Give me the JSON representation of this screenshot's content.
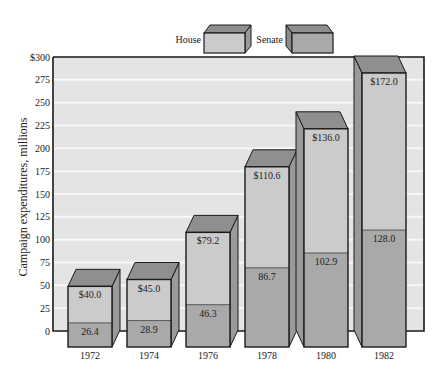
{
  "chart_data": {
    "type": "bar",
    "stacked": true,
    "style": "3d",
    "title": "",
    "xlabel": "",
    "ylabel": "Campaign expenditures, millions",
    "ylim": [
      0,
      300
    ],
    "yticks": [
      "$300",
      "275",
      "250",
      "225",
      "200",
      "175",
      "150",
      "125",
      "100",
      "75",
      "50",
      "25",
      "0"
    ],
    "categories": [
      "1972",
      "1974",
      "1976",
      "1978",
      "1980",
      "1982"
    ],
    "series": [
      {
        "name": "Senate",
        "values": [
          26.4,
          28.9,
          46.3,
          86.7,
          102.9,
          128.0
        ],
        "labels": [
          "26.4",
          "28.9",
          "46.3",
          "86.7",
          "102.9",
          "128.0"
        ],
        "color": "#a9a9a9",
        "position": "bottom"
      },
      {
        "name": "House",
        "values": [
          40.0,
          45.0,
          79.2,
          110.6,
          136.0,
          172.0
        ],
        "labels": [
          "$40.0",
          "$45.0",
          "$79.2",
          "$110.6",
          "$136.0",
          "$172.0"
        ],
        "color": "#cbcbcb",
        "position": "top"
      }
    ],
    "legend": {
      "position": "top-center",
      "entries": [
        "House",
        "Senate"
      ]
    },
    "grid": true
  },
  "legend": {
    "house_label": "House",
    "senate_label": "Senate"
  },
  "axis": {
    "ylabel": "Campaign expenditures, millions"
  },
  "colors": {
    "panel": "#e4e4e4",
    "gridline": "#f7f7f7",
    "house_front": "#cbcbcb",
    "senate_front": "#a9a9a9",
    "top_face": "#8f8f8f",
    "side_face": "#9a9a9a",
    "outline": "#1a1a1a"
  }
}
